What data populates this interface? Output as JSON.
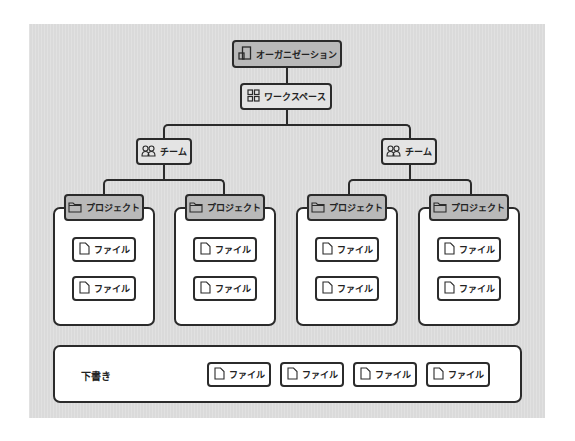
{
  "diagram": {
    "organization": {
      "label": "オーガニゼーション",
      "icon": "organization-icon"
    },
    "workspace": {
      "label": "ワークスペース",
      "icon": "grid-icon"
    },
    "teams": [
      {
        "label": "チーム",
        "icon": "team-icon",
        "projects": [
          {
            "label": "プロジェクト",
            "icon": "folder-icon",
            "files": [
              {
                "label": "ファイル"
              },
              {
                "label": "ファイル"
              }
            ]
          },
          {
            "label": "プロジェクト",
            "icon": "folder-icon",
            "files": [
              {
                "label": "ファイル"
              },
              {
                "label": "ファイル"
              }
            ]
          }
        ]
      },
      {
        "label": "チーム",
        "icon": "team-icon",
        "projects": [
          {
            "label": "プロジェクト",
            "icon": "folder-icon",
            "files": [
              {
                "label": "ファイル"
              },
              {
                "label": "ファイル"
              }
            ]
          },
          {
            "label": "プロジェクト",
            "icon": "folder-icon",
            "files": [
              {
                "label": "ファイル"
              },
              {
                "label": "ファイル"
              }
            ]
          }
        ]
      }
    ],
    "drafts": {
      "label": "下書き",
      "files": [
        {
          "label": "ファイル"
        },
        {
          "label": "ファイル"
        },
        {
          "label": "ファイル"
        },
        {
          "label": "ファイル"
        }
      ]
    },
    "colors": {
      "canvas": "#dedede",
      "org_fill": "#b9b9b9",
      "workspace_fill": "#e4e4e4",
      "project_fill": "#b9b9b9",
      "node_border": "#2b2b2b",
      "white": "#ffffff"
    }
  }
}
